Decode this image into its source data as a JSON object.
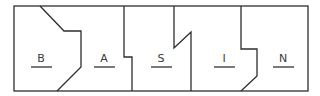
{
  "diagram": {
    "type": "puzzle-strip",
    "pieces": [
      {
        "label": "B",
        "cx": 41
      },
      {
        "label": "A",
        "cx": 104
      },
      {
        "label": "S",
        "cx": 161
      },
      {
        "label": "I",
        "cx": 224
      },
      {
        "label": "N",
        "cx": 283
      }
    ],
    "colors": {
      "outline": "#2e2e2e",
      "label": "#3a3a3a",
      "underline": "#7a7a7a"
    }
  }
}
